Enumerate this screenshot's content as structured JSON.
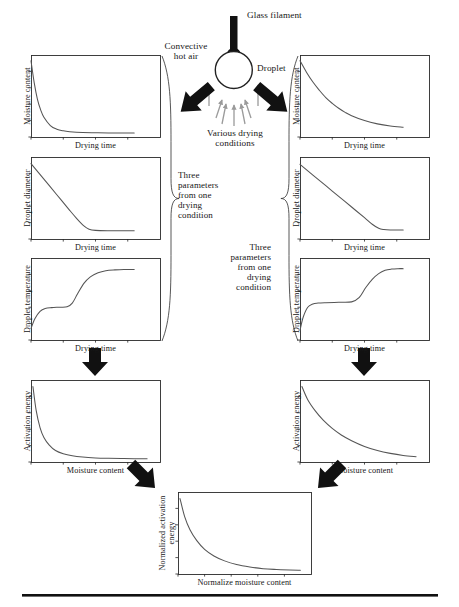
{
  "figure": {
    "background": "#ffffff",
    "line_color": "#555555",
    "frame_color": "#2a2a2a",
    "arrow_color": "#111111",
    "text_color": "#161616"
  },
  "apparatus": {
    "filament_label": "Glass filament",
    "droplet_label": "Droplet",
    "convective_label": "Convective\nhot air",
    "conditions_label": "Various drying\nconditions",
    "filament_color": "#111111",
    "droplet_outline": "#222222",
    "air_arrow_color": "#9a9a9a"
  },
  "braces": {
    "left_label": "Three\nparameters\nfrom one\ndrying\ncondition",
    "right_label": "Three\nparameters\nfrom one\ndrying\ncondition"
  },
  "bottom_rule": {
    "color": "#111111"
  },
  "chart_data": [
    {
      "id": "left-moisture",
      "type": "line",
      "title": "",
      "xlabel": "Drying time",
      "ylabel": "Moisture content",
      "xlim": [
        0,
        10
      ],
      "ylim": [
        0,
        10
      ],
      "grid": false,
      "legend": "none",
      "xticks": [
        0,
        2.5,
        5,
        7.5
      ],
      "yticks": [
        0,
        2,
        4,
        6,
        8
      ],
      "series": [
        {
          "name": "moisture content vs drying time (fast decay)",
          "x": [
            0,
            0.25,
            0.5,
            0.75,
            1,
            1.5,
            2,
            2.5,
            3,
            4,
            5,
            6,
            7,
            8
          ],
          "y": [
            9.3,
            6.6,
            4.6,
            3.3,
            2.4,
            1.4,
            0.95,
            0.75,
            0.65,
            0.55,
            0.52,
            0.5,
            0.5,
            0.5
          ]
        }
      ]
    },
    {
      "id": "left-diameter",
      "type": "line",
      "title": "",
      "xlabel": "Drying time",
      "ylabel": "Droplet diameter",
      "xlim": [
        0,
        10
      ],
      "ylim": [
        0,
        10
      ],
      "grid": false,
      "legend": "none",
      "xticks": [
        0,
        2.5,
        5,
        7.5
      ],
      "yticks": [
        0,
        2,
        4,
        6,
        8
      ],
      "series": [
        {
          "name": "droplet diameter vs drying time (linear shrink then plateau)",
          "x": [
            0,
            1,
            2,
            3,
            3.6,
            4.1,
            4.5,
            5,
            6,
            7,
            8
          ],
          "y": [
            9.2,
            7.3,
            5.4,
            3.5,
            2.4,
            1.6,
            1.2,
            1.05,
            1.0,
            1.0,
            1.0
          ]
        }
      ]
    },
    {
      "id": "left-temperature",
      "type": "line",
      "title": "",
      "xlabel": "Drying time",
      "ylabel": "Droplet temperature",
      "xlim": [
        0,
        10
      ],
      "ylim": [
        0,
        10
      ],
      "grid": false,
      "legend": "none",
      "xticks": [
        0,
        2.5,
        5,
        7.5
      ],
      "yticks": [
        0,
        2,
        4,
        6,
        8
      ],
      "series": [
        {
          "name": "droplet temperature vs drying time (two-stage rise)",
          "x": [
            0,
            0.3,
            0.7,
            1.1,
            1.6,
            2.2,
            2.8,
            3.2,
            3.6,
            4.1,
            4.6,
            5.2,
            5.8,
            6.5,
            7.2,
            8
          ],
          "y": [
            1.4,
            2.6,
            3.5,
            3.85,
            3.95,
            4.0,
            4.05,
            4.5,
            5.6,
            6.9,
            7.7,
            8.2,
            8.45,
            8.55,
            8.6,
            8.6
          ]
        }
      ]
    },
    {
      "id": "right-moisture",
      "type": "line",
      "title": "",
      "xlabel": "Drying time",
      "ylabel": "Moisture content",
      "xlim": [
        0,
        10
      ],
      "ylim": [
        0,
        10
      ],
      "grid": false,
      "legend": "none",
      "xticks": [
        0,
        2.5,
        5,
        7.5
      ],
      "yticks": [
        0,
        2,
        4,
        6,
        8
      ],
      "series": [
        {
          "name": "moisture content vs drying time (slow decay)",
          "x": [
            0,
            0.5,
            1,
            1.5,
            2,
            2.5,
            3,
            3.5,
            4,
            5,
            6,
            7,
            8
          ],
          "y": [
            9.3,
            7.9,
            6.7,
            5.7,
            4.8,
            4.1,
            3.5,
            3.0,
            2.6,
            2.0,
            1.6,
            1.35,
            1.2
          ]
        }
      ]
    },
    {
      "id": "right-diameter",
      "type": "line",
      "title": "",
      "xlabel": "Drying time",
      "ylabel": "Droplet diameter",
      "xlim": [
        0,
        10
      ],
      "ylim": [
        0,
        10
      ],
      "grid": false,
      "legend": "none",
      "xticks": [
        0,
        2.5,
        5,
        7.5
      ],
      "yticks": [
        0,
        2,
        4,
        6,
        8
      ],
      "series": [
        {
          "name": "droplet diameter vs drying time (gradual linear shrink then plateau)",
          "x": [
            0,
            1,
            2,
            3,
            4,
            5,
            5.6,
            6.1,
            6.5,
            7,
            8
          ],
          "y": [
            9.1,
            7.8,
            6.5,
            5.2,
            3.9,
            2.6,
            1.8,
            1.3,
            1.15,
            1.1,
            1.1
          ]
        }
      ]
    },
    {
      "id": "right-temperature",
      "type": "line",
      "title": "",
      "xlabel": "Drying time",
      "ylabel": "Droplet temperature",
      "xlim": [
        0,
        10
      ],
      "ylim": [
        0,
        10
      ],
      "grid": false,
      "legend": "none",
      "xticks": [
        0,
        2.5,
        5,
        7.5
      ],
      "yticks": [
        0,
        2,
        4,
        6,
        8
      ],
      "series": [
        {
          "name": "droplet temperature vs drying time (long plateau then rise)",
          "x": [
            0,
            0.25,
            0.6,
            1.0,
            1.4,
            2,
            3,
            4,
            4.6,
            5.1,
            5.6,
            6.1,
            6.6,
            7.1,
            7.6,
            8
          ],
          "y": [
            1.2,
            2.8,
            4.0,
            4.4,
            4.5,
            4.55,
            4.6,
            4.65,
            5.2,
            6.4,
            7.4,
            8.1,
            8.5,
            8.65,
            8.7,
            8.7
          ]
        }
      ]
    },
    {
      "id": "left-activation",
      "type": "line",
      "title": "",
      "xlabel": "Moisture content",
      "ylabel": "Activation energy",
      "xlim": [
        0,
        10
      ],
      "ylim": [
        0,
        10
      ],
      "grid": false,
      "legend": "none",
      "xticks": [
        0,
        2.5,
        5,
        7.5
      ],
      "yticks": [
        0,
        2,
        4,
        6,
        8
      ],
      "series": [
        {
          "name": "activation energy vs moisture content (sharp decay)",
          "x": [
            0.15,
            0.4,
            0.7,
            1,
            1.4,
            1.9,
            2.5,
            3.2,
            4,
            5,
            6,
            7,
            8,
            9
          ],
          "y": [
            9.2,
            6.3,
            4.2,
            3.0,
            2.1,
            1.4,
            1.0,
            0.75,
            0.6,
            0.5,
            0.45,
            0.42,
            0.4,
            0.4
          ]
        }
      ]
    },
    {
      "id": "right-activation",
      "type": "line",
      "title": "",
      "xlabel": "Moisture content",
      "ylabel": "Activation energy",
      "xlim": [
        0,
        10
      ],
      "ylim": [
        0,
        10
      ],
      "grid": false,
      "legend": "none",
      "xticks": [
        0,
        2.5,
        5,
        7.5
      ],
      "yticks": [
        0,
        2,
        4,
        6,
        8
      ],
      "series": [
        {
          "name": "activation energy vs moisture content (gradual decay)",
          "x": [
            0.15,
            0.6,
            1.2,
            1.8,
            2.5,
            3.2,
            4,
            5,
            6,
            7,
            8,
            9
          ],
          "y": [
            9.2,
            7.6,
            6.2,
            5.1,
            4.1,
            3.3,
            2.6,
            1.9,
            1.4,
            1.05,
            0.8,
            0.65
          ]
        }
      ]
    },
    {
      "id": "bottom-normalized",
      "type": "line",
      "title": "",
      "xlabel": "Normalize moisture content",
      "ylabel": "Normalized activation\nenergy",
      "xlim": [
        0,
        10
      ],
      "ylim": [
        0,
        10
      ],
      "grid": false,
      "legend": "none",
      "xticks": [
        0,
        2,
        4,
        6,
        8
      ],
      "yticks": [
        0,
        2,
        4,
        6,
        8
      ],
      "series": [
        {
          "name": "normalized activation energy vs normalized moisture content",
          "x": [
            0.15,
            0.5,
            0.9,
            1.4,
            2,
            2.7,
            3.5,
            4.4,
            5.4,
            6.4,
            7.4,
            8.4,
            9.2
          ],
          "y": [
            9.2,
            7.0,
            5.4,
            4.1,
            3.0,
            2.2,
            1.6,
            1.15,
            0.85,
            0.65,
            0.55,
            0.48,
            0.45
          ]
        }
      ]
    }
  ]
}
